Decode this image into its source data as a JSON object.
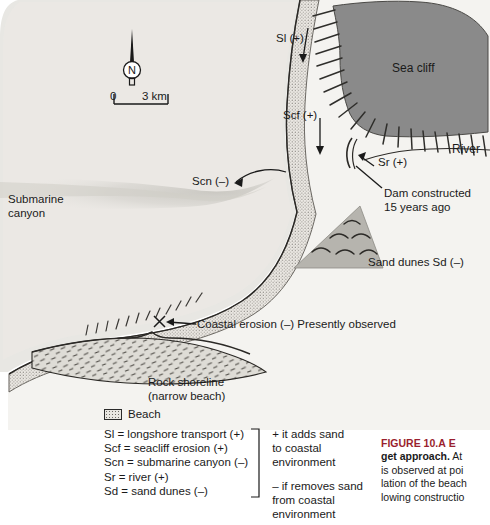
{
  "figure": {
    "domain": "coastal-sediment-budget-map",
    "colors": {
      "ocean": "#e6e5e1",
      "land": "#f3f2ef",
      "sea_cliff": "#8a8a8a",
      "beach_stipple": "#e9e7e2",
      "sand_dunes": "#b5b3ad",
      "rock_shoreline": "#d9d7d1",
      "submarine_canyon": "#d2d0cb",
      "ink": "#1a1a1a",
      "caption_accent": "#9a1f2e"
    }
  },
  "compass": {
    "north_label": "N",
    "icon": "compass-north-needle"
  },
  "scale_bar": {
    "zero_label": "0",
    "max_label": "3 km"
  },
  "map_labels": {
    "longshore_transport": "Sl (+)",
    "seacliff_erosion": "Scf (+)",
    "submarine_canyon_arrow": "Scn (–)",
    "river": "Sr (+)",
    "sea_cliff": "Sea cliff",
    "river_feature": "River",
    "dam_line1": "Dam constructed",
    "dam_line2": "15 years ago",
    "sand_dunes": "Sand dunes Sd (–)",
    "submarine_canyon_line1": "Submarine",
    "submarine_canyon_line2": "canyon",
    "coastal_erosion": "Coastal erosion (–) Presently observed",
    "rock_shoreline_line1": "Rock shoreline",
    "rock_shoreline_line2": "(narrow beach)"
  },
  "legend": {
    "beach_label": "Beach",
    "keys": [
      "Sl = longshore transport (+)",
      "Scf = seacliff erosion (+)",
      "Scn = submarine canyon (–)",
      "Sr = river (+)",
      "Sd = sand dunes (–)"
    ],
    "note_plus_line1": "+ it adds sand",
    "note_plus_line2": "to coastal environment",
    "note_minus_line1": "– if removes sand",
    "note_minus_line2": "from coastal environment"
  },
  "caption": {
    "figure_number": "FIGURE 10.A",
    "title_head": "E",
    "title_bold": "get approach.",
    "line2_rest": "At",
    "line3": "is observed at poi",
    "line4": "lation of the beach",
    "line5": "lowing constructio"
  }
}
